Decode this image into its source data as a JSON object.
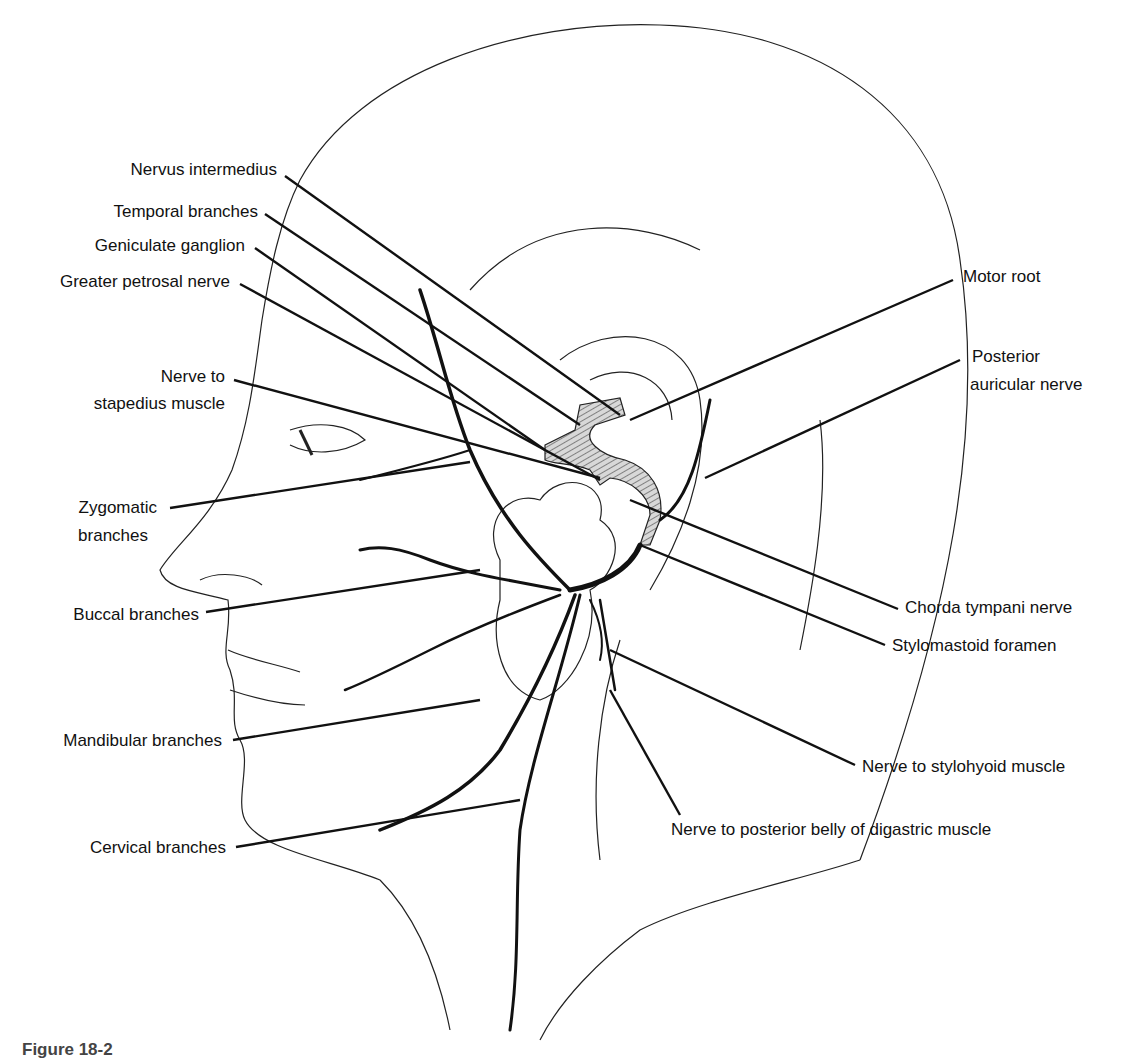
{
  "figure": {
    "caption_partial": "Figure 18-2",
    "labels": {
      "nervus_intermedius": "Nervus intermedius",
      "temporal_branches": "Temporal branches",
      "geniculate_ganglion": "Geniculate ganglion",
      "greater_petrosal_nerve": "Greater petrosal nerve",
      "nerve_to_stapedius_1": "Nerve to",
      "nerve_to_stapedius_2": "stapedius muscle",
      "zygomatic_1": "Zygomatic",
      "zygomatic_2": "branches",
      "buccal_branches": "Buccal branches",
      "mandibular_branches": "Mandibular branches",
      "cervical_branches": "Cervical branches",
      "motor_root": "Motor root",
      "posterior_auricular_1": "Posterior",
      "posterior_auricular_2": "auricular nerve",
      "chorda_tympani": "Chorda tympani nerve",
      "stylomastoid_foramen": "Stylomastoid foramen",
      "nerve_to_stylohyoid": "Nerve to stylohyoid muscle",
      "nerve_to_digastric": "Nerve to posterior belly of digastric muscle"
    }
  }
}
